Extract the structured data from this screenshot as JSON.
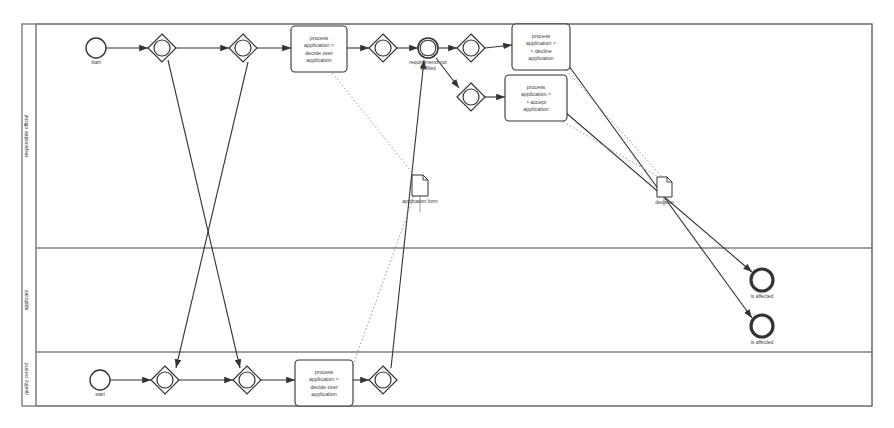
{
  "diagram": {
    "type": "bpmn-process",
    "canvas": {
      "width": 894,
      "height": 428
    },
    "colors": {
      "stroke": "#555555",
      "stroke_dark": "#333333",
      "background": "#ffffff",
      "text": "#3a3a3a",
      "lane_border": "#777777",
      "pool_border": "#666666"
    }
  },
  "pool": {
    "name": "pool",
    "x": 22,
    "y": 24,
    "width": 850,
    "height": 382,
    "label_band_width": 14
  },
  "lanes": [
    {
      "id": "lane-responsible-official",
      "label": "responsible official",
      "x": 36,
      "y": 24,
      "width": 836,
      "height": 224
    },
    {
      "id": "lane-applicant",
      "label": "applicant",
      "x": 36,
      "y": 248,
      "width": 836,
      "height": 104
    },
    {
      "id": "lane-quality-control",
      "label": "quality control",
      "x": 36,
      "y": 352,
      "width": 836,
      "height": 54
    }
  ],
  "events": [
    {
      "id": "start-top",
      "kind": "start-event",
      "label": "start",
      "cx": 96,
      "cy": 48,
      "r": 10,
      "stroke_width": 1.4,
      "label_dy": 16
    },
    {
      "id": "intermediate-requirements",
      "kind": "intermediate-event",
      "label": "requirements not fulfilled",
      "cx": 428,
      "cy": 48,
      "r": 10,
      "stroke_width": 1.6,
      "label_dy": 16
    },
    {
      "id": "start-bottom",
      "kind": "start-event",
      "label": "start",
      "cx": 100,
      "cy": 380,
      "r": 10,
      "stroke_width": 1.4,
      "label_dy": 16
    },
    {
      "id": "end-affected-1",
      "kind": "end-event",
      "label": "is affected",
      "cx": 762,
      "cy": 280,
      "r": 11,
      "stroke_width": 3.2,
      "label_dy": 18
    },
    {
      "id": "end-affected-2",
      "kind": "end-event",
      "label": "is affected",
      "cx": 762,
      "cy": 326,
      "r": 11,
      "stroke_width": 3.2,
      "label_dy": 18
    }
  ],
  "gateways": [
    {
      "id": "gw-top-1",
      "cx": 162,
      "cy": 48,
      "half": 14,
      "inner_r": 8
    },
    {
      "id": "gw-top-2",
      "cx": 243,
      "cy": 48,
      "half": 14,
      "inner_r": 8
    },
    {
      "id": "gw-top-3",
      "cx": 383,
      "cy": 48,
      "half": 14,
      "inner_r": 8
    },
    {
      "id": "gw-top-4",
      "cx": 471,
      "cy": 48,
      "half": 14,
      "inner_r": 8
    },
    {
      "id": "gw-top-5",
      "cx": 471,
      "cy": 97,
      "half": 14,
      "inner_r": 8
    },
    {
      "id": "gw-bottom-1",
      "cx": 165,
      "cy": 380,
      "half": 14,
      "inner_r": 8
    },
    {
      "id": "gw-bottom-2",
      "cx": 247,
      "cy": 380,
      "half": 14,
      "inner_r": 8
    },
    {
      "id": "gw-bottom-3",
      "cx": 383,
      "cy": 380,
      "half": 14,
      "inner_r": 8
    }
  ],
  "tasks": [
    {
      "id": "task-decide-over",
      "label": "process application > decide over application",
      "lines": [
        "process",
        "application >",
        "decide over",
        "application"
      ],
      "x": 291,
      "y": 26,
      "width": 56,
      "height": 46
    },
    {
      "id": "task-decline",
      "label": "process application > > decline application",
      "lines": [
        "process",
        "application >",
        "> decline",
        "application"
      ],
      "x": 512,
      "y": 24,
      "width": 58,
      "height": 46
    },
    {
      "id": "task-accept",
      "label": "process application > > accept application",
      "lines": [
        "process",
        "application >",
        "> accept",
        "application"
      ],
      "x": 505,
      "y": 75,
      "width": 62,
      "height": 46
    },
    {
      "id": "task-decide-over-qc",
      "label": "process application > decide over application",
      "lines": [
        "process",
        "application >",
        "decide over",
        "application"
      ],
      "x": 295,
      "y": 360,
      "width": 58,
      "height": 46
    }
  ],
  "data_objects": [
    {
      "id": "data-application-form",
      "label": "application form",
      "x": 412,
      "y": 175,
      "width": 16,
      "height": 21
    },
    {
      "id": "data-decision",
      "label": "decision",
      "x": 657,
      "y": 177,
      "width": 15,
      "height": 20
    }
  ],
  "sequence_flows": [
    {
      "id": "f-start-top-gw1",
      "points": "106,48 148,48",
      "arrow": true
    },
    {
      "id": "f-gw1-gw2",
      "points": "176,48 229,48",
      "arrow": true
    },
    {
      "id": "f-gw2-task1",
      "points": "257,48 291,48",
      "arrow": true
    },
    {
      "id": "f-task1-gw3",
      "points": "347,48 369,48",
      "arrow": true
    },
    {
      "id": "f-gw3-int",
      "points": "397,48 418,48",
      "arrow": true
    },
    {
      "id": "f-int-gw4",
      "points": "438,48 457,48",
      "arrow": true
    },
    {
      "id": "f-gw4-decline",
      "points": "485,48 512,45",
      "arrow": true
    },
    {
      "id": "f-gw5-accept",
      "points": "485,97 505,97",
      "arrow": true
    },
    {
      "id": "f-start-bot-gw1",
      "points": "110,380 151,380",
      "arrow": true
    },
    {
      "id": "f-gwb1-gwb2",
      "points": "179,380 233,380",
      "arrow": true
    },
    {
      "id": "f-gwb2-taskqc",
      "points": "261,380 295,380",
      "arrow": true
    },
    {
      "id": "f-taskqc-gwb3",
      "points": "353,380 369,380",
      "arrow": true
    },
    {
      "id": "f-cross-1",
      "points": "168,60 240,368",
      "arrow": true
    },
    {
      "id": "f-cross-2",
      "points": "248,62 176,368",
      "arrow": true
    },
    {
      "id": "f-gwb3-up",
      "points": "391,368 424,60",
      "arrow": true
    },
    {
      "id": "f-int-down-gw5",
      "points": "436,58 459,88",
      "arrow": true
    },
    {
      "id": "f-decline-end2",
      "points": "566,62 752,318",
      "arrow": true
    },
    {
      "id": "f-accept-end1",
      "points": "565,112 752,272",
      "arrow": true
    }
  ],
  "associations": [
    {
      "id": "a-task1-form",
      "points": "330,70 418,180",
      "dashed": true
    },
    {
      "id": "a-form-qc",
      "points": "414,196 352,368",
      "dashed": true
    },
    {
      "id": "a-accept-decision",
      "points": "560,120 660,178",
      "dashed": true
    },
    {
      "id": "a-decline-decision",
      "points": "566,70 662,177",
      "dashed": true
    },
    {
      "id": "a-decision-down",
      "points": "664,197 670,205",
      "dashed": true
    }
  ],
  "data_flow_lines": [
    {
      "id": "d-form-vert",
      "points": "420,196 420,212"
    },
    {
      "id": "d-decision-vert",
      "points": "664,197 664,206"
    }
  ]
}
